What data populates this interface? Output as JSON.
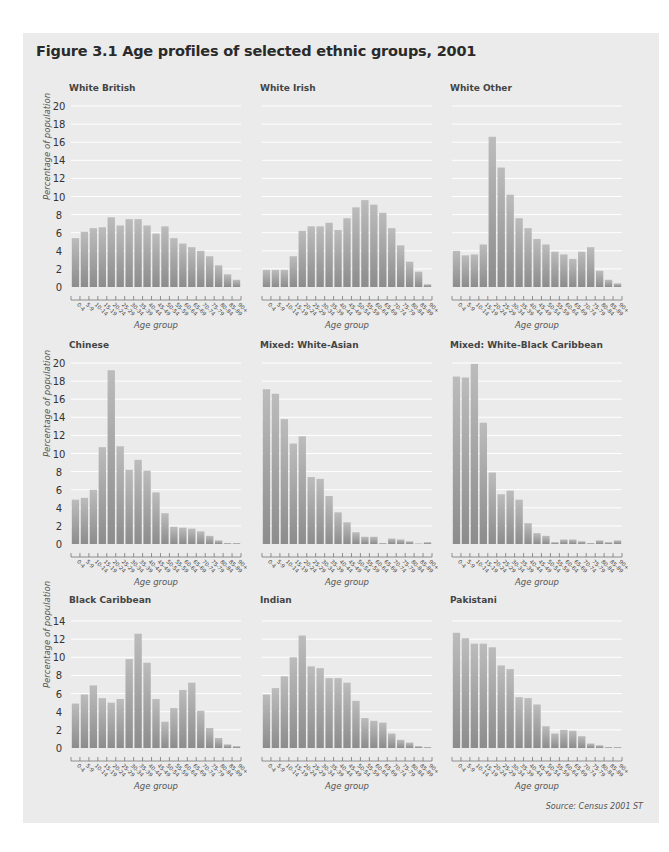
{
  "figure": {
    "title": "Figure 3.1  Age profiles of selected ethnic groups, 2001",
    "source": "Source: Census 2001 ST",
    "colors": {
      "panel_bg": "#ebebeb",
      "bar_top": "#b9b9b9",
      "bar_bottom": "#8e8e8e",
      "grid": "#ffffff"
    }
  },
  "chart_data": [
    {
      "type": "bar",
      "title": "White British",
      "xlabel": "Age group",
      "ylabel": "Percentage of population",
      "ylim": [
        0,
        20
      ],
      "yticks": [
        0,
        2,
        4,
        6,
        8,
        10,
        12,
        14,
        16,
        18,
        20
      ],
      "grid": true,
      "categories": [
        "0-4",
        "5-9",
        "10-14",
        "15-19",
        "20-24",
        "25-29",
        "30-34",
        "35-39",
        "40-44",
        "45-49",
        "50-54",
        "55-59",
        "60-64",
        "65-69",
        "70-74",
        "75-79",
        "80-84",
        "85-89",
        "90+"
      ],
      "values": [
        5.4,
        6.1,
        6.5,
        6.6,
        7.7,
        6.8,
        7.5,
        7.5,
        6.8,
        5.9,
        6.7,
        5.4,
        4.8,
        4.4,
        4.0,
        3.4,
        2.4,
        1.4,
        0.8
      ]
    },
    {
      "type": "bar",
      "title": "White Irish",
      "xlabel": "Age group",
      "ylabel": "",
      "ylim": [
        0,
        20
      ],
      "yticks": [
        0,
        2,
        4,
        6,
        8,
        10,
        12,
        14,
        16,
        18,
        20
      ],
      "grid": true,
      "categories": [
        "0-4",
        "5-9",
        "10-14",
        "15-19",
        "20-24",
        "25-29",
        "30-34",
        "35-39",
        "40-44",
        "45-49",
        "50-54",
        "55-59",
        "60-64",
        "65-69",
        "70-74",
        "75-79",
        "80-84",
        "85-89",
        "90+"
      ],
      "values": [
        1.9,
        1.9,
        1.9,
        3.4,
        6.2,
        6.7,
        6.7,
        7.1,
        6.3,
        7.6,
        8.8,
        9.6,
        9.1,
        8.2,
        6.5,
        4.6,
        2.8,
        1.7,
        0.3
      ]
    },
    {
      "type": "bar",
      "title": "White Other",
      "xlabel": "Age group",
      "ylabel": "",
      "ylim": [
        0,
        20
      ],
      "yticks": [
        0,
        2,
        4,
        6,
        8,
        10,
        12,
        14,
        16,
        18,
        20
      ],
      "grid": true,
      "categories": [
        "0-4",
        "5-9",
        "10-14",
        "15-19",
        "20-24",
        "25-29",
        "30-34",
        "35-39",
        "40-44",
        "45-49",
        "50-54",
        "55-59",
        "60-64",
        "65-69",
        "70-74",
        "75-79",
        "80-84",
        "85-89",
        "90+"
      ],
      "values": [
        4.0,
        3.5,
        3.6,
        4.7,
        16.6,
        13.2,
        10.2,
        7.6,
        6.5,
        5.3,
        4.7,
        3.9,
        3.6,
        3.1,
        3.9,
        4.4,
        1.8,
        0.8,
        0.4
      ]
    },
    {
      "type": "bar",
      "title": "Chinese",
      "xlabel": "Age group",
      "ylabel": "Percentage of population",
      "ylim": [
        0,
        20
      ],
      "yticks": [
        0,
        2,
        4,
        6,
        8,
        10,
        12,
        14,
        16,
        18,
        20
      ],
      "grid": true,
      "categories": [
        "0-4",
        "5-9",
        "10-14",
        "15-19",
        "20-24",
        "25-29",
        "30-34",
        "35-39",
        "40-44",
        "45-49",
        "50-54",
        "55-59",
        "60-64",
        "65-69",
        "70-74",
        "75-79",
        "80-84",
        "85-89",
        "90+"
      ],
      "values": [
        4.9,
        5.1,
        6.0,
        10.7,
        19.2,
        10.8,
        8.2,
        9.3,
        8.1,
        5.7,
        3.4,
        1.9,
        1.8,
        1.7,
        1.4,
        0.9,
        0.4,
        0.1,
        0.1
      ]
    },
    {
      "type": "bar",
      "title": "Mixed: White-Asian",
      "xlabel": "Age group",
      "ylabel": "",
      "ylim": [
        0,
        20
      ],
      "yticks": [
        0,
        2,
        4,
        6,
        8,
        10,
        12,
        14,
        16,
        18,
        20
      ],
      "grid": true,
      "categories": [
        "0-4",
        "5-9",
        "10-14",
        "15-19",
        "20-24",
        "25-29",
        "30-34",
        "35-39",
        "40-44",
        "45-49",
        "50-54",
        "55-59",
        "60-64",
        "65-69",
        "70-74",
        "75-79",
        "80-84",
        "85-89",
        "90+"
      ],
      "values": [
        17.1,
        16.6,
        13.8,
        11.1,
        11.9,
        7.4,
        7.2,
        5.3,
        3.5,
        2.4,
        1.3,
        0.8,
        0.8,
        0.1,
        0.6,
        0.5,
        0.3,
        0.0,
        0.2
      ]
    },
    {
      "type": "bar",
      "title": "Mixed: White-Black Caribbean",
      "xlabel": "Age group",
      "ylabel": "",
      "ylim": [
        0,
        20
      ],
      "yticks": [
        0,
        2,
        4,
        6,
        8,
        10,
        12,
        14,
        16,
        18,
        20
      ],
      "grid": true,
      "categories": [
        "0-4",
        "5-9",
        "10-14",
        "15-19",
        "20-24",
        "25-29",
        "30-34",
        "35-39",
        "40-44",
        "45-49",
        "50-54",
        "55-59",
        "60-64",
        "65-69",
        "70-74",
        "75-79",
        "80-84",
        "85-89",
        "90+"
      ],
      "values": [
        18.5,
        18.4,
        19.9,
        13.4,
        7.9,
        5.5,
        5.9,
        4.9,
        2.3,
        1.2,
        0.9,
        0.2,
        0.5,
        0.5,
        0.3,
        0.1,
        0.4,
        0.2,
        0.4
      ]
    },
    {
      "type": "bar",
      "title": "Black Caribbean",
      "xlabel": "Age group",
      "ylabel": "Percentage of population",
      "ylim": [
        0,
        14
      ],
      "yticks": [
        0,
        2,
        4,
        6,
        8,
        10,
        12,
        14
      ],
      "grid": true,
      "categories": [
        "0-4",
        "5-9",
        "10-14",
        "15-19",
        "20-24",
        "25-29",
        "30-34",
        "35-39",
        "40-44",
        "45-49",
        "50-54",
        "55-59",
        "60-64",
        "65-69",
        "70-74",
        "75-79",
        "80-84",
        "85-89",
        "90+"
      ],
      "values": [
        4.9,
        5.9,
        6.9,
        5.5,
        5.0,
        5.4,
        9.8,
        12.6,
        9.4,
        5.4,
        2.9,
        4.4,
        6.4,
        7.2,
        4.1,
        2.2,
        1.1,
        0.4,
        0.2
      ]
    },
    {
      "type": "bar",
      "title": "Indian",
      "xlabel": "Age group",
      "ylabel": "",
      "ylim": [
        0,
        14
      ],
      "yticks": [
        0,
        2,
        4,
        6,
        8,
        10,
        12,
        14
      ],
      "grid": true,
      "categories": [
        "0-4",
        "5-9",
        "10-14",
        "15-19",
        "20-24",
        "25-29",
        "30-34",
        "35-39",
        "40-44",
        "45-49",
        "50-54",
        "55-59",
        "60-64",
        "65-69",
        "70-74",
        "75-79",
        "80-84",
        "85-89",
        "90+"
      ],
      "values": [
        5.9,
        6.6,
        7.9,
        10.0,
        12.4,
        9.0,
        8.8,
        7.7,
        7.7,
        7.2,
        5.2,
        3.3,
        3.0,
        2.8,
        1.6,
        0.9,
        0.6,
        0.2,
        0.1
      ]
    },
    {
      "type": "bar",
      "title": "Pakistani",
      "xlabel": "Age group",
      "ylabel": "",
      "ylim": [
        0,
        14
      ],
      "yticks": [
        0,
        2,
        4,
        6,
        8,
        10,
        12,
        14
      ],
      "grid": true,
      "categories": [
        "0-4",
        "5-9",
        "10-14",
        "15-19",
        "20-24",
        "25-29",
        "30-34",
        "35-39",
        "40-44",
        "45-49",
        "50-54",
        "55-59",
        "60-64",
        "65-69",
        "70-74",
        "75-79",
        "80-84",
        "85-89",
        "90+"
      ],
      "values": [
        12.7,
        12.1,
        11.5,
        11.5,
        11.1,
        9.1,
        8.7,
        5.6,
        5.5,
        4.8,
        2.4,
        1.6,
        2.0,
        1.9,
        1.3,
        0.5,
        0.3,
        0.1,
        0.1
      ]
    }
  ]
}
